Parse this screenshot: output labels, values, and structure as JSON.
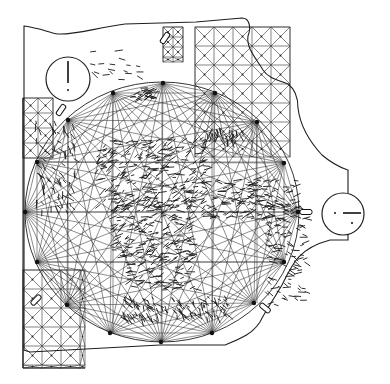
{
  "map": {
    "title": "Portolan chart (rhumb-line navigation chart)",
    "style": "scanned black-and-white line drawing",
    "colors": {
      "ink": "#2a2a2a",
      "paper": "#ffffff"
    },
    "wind_circle": {
      "center": [
        162,
        212
      ],
      "radius_x": 137,
      "radius_y": 130,
      "nodes": [
        [
          25,
          212
        ],
        [
          37,
          162
        ],
        [
          68,
          120
        ],
        [
          113,
          93
        ],
        [
          163,
          83
        ],
        [
          215,
          93
        ],
        [
          257,
          122
        ],
        [
          284,
          163
        ],
        [
          298,
          212
        ],
        [
          284,
          262
        ],
        [
          254,
          303
        ],
        [
          212,
          333
        ],
        [
          161,
          342
        ],
        [
          110,
          333
        ],
        [
          67,
          305
        ],
        [
          37,
          262
        ]
      ]
    },
    "scale_circles": [
      {
        "name": "scale-circle-northwest",
        "cx": 68,
        "cy": 79,
        "r": 22,
        "bar": "vertical"
      },
      {
        "name": "scale-circle-east",
        "cx": 343,
        "cy": 214,
        "r": 21,
        "bar": "horizontal"
      }
    ],
    "grid_regions": [
      {
        "name": "grid-north-box",
        "x": 163,
        "y": 27,
        "w": 20,
        "h": 35,
        "cell": 10
      },
      {
        "name": "grid-northeast",
        "x": 195,
        "y": 27,
        "w": 95,
        "h": 130,
        "cell": 19
      },
      {
        "name": "grid-west",
        "x": 23,
        "y": 98,
        "w": 30,
        "h": 60,
        "cell": 15
      },
      {
        "name": "grid-southwest",
        "x": 23,
        "y": 270,
        "w": 62,
        "h": 98,
        "cell": 19
      }
    ],
    "text_labels": []
  }
}
